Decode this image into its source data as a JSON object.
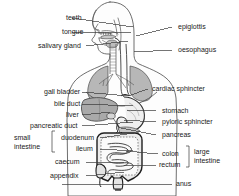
{
  "figure": {
    "background_color": "#ffffff",
    "text_color": "#1a1a1a",
    "line_color": "#3a3a3a",
    "width": 239,
    "height": 196
  },
  "labels_left": [
    {
      "id": "teeth",
      "text": "teeth",
      "x": 66,
      "y": 14,
      "line_x1": 72,
      "line_y1": 18,
      "line_x2": 133,
      "line_y2": 27
    },
    {
      "id": "tongue",
      "text": "tongue",
      "x": 62,
      "y": 28,
      "line_x1": 72,
      "line_y1": 32,
      "line_x2": 131,
      "line_y2": 33
    },
    {
      "id": "salivary-gland",
      "text": "salivary gland",
      "x": 38,
      "y": 42,
      "line_x1": 86,
      "line_y1": 46,
      "line_x2": 128,
      "line_y2": 41
    },
    {
      "id": "gall-bladder",
      "text": "gall bladder",
      "x": 44,
      "y": 88,
      "line_x1": 82,
      "line_y1": 92,
      "line_x2": 129,
      "line_y2": 96
    },
    {
      "id": "bile-duct",
      "text": "bile duct",
      "x": 54,
      "y": 100,
      "line_x1": 82,
      "line_y1": 104,
      "line_x2": 133,
      "line_y2": 106
    },
    {
      "id": "liver",
      "text": "liver",
      "x": 66,
      "y": 111,
      "line_x1": 82,
      "line_y1": 115,
      "line_x2": 110,
      "line_y2": 112
    },
    {
      "id": "pancreatic-duct",
      "text": "pancreatic duct",
      "x": 30,
      "y": 122,
      "line_x1": 82,
      "line_y1": 126,
      "line_x2": 133,
      "line_y2": 122
    },
    {
      "id": "duodenum",
      "text": "duodenum",
      "x": 61,
      "y": 134,
      "line_x1": 100,
      "line_y1": 138,
      "line_x2": 134,
      "line_y2": 133
    },
    {
      "id": "ileum",
      "text": "ileum",
      "x": 76,
      "y": 145,
      "line_x1": 100,
      "line_y1": 149,
      "line_x2": 133,
      "line_y2": 151
    },
    {
      "id": "caecum",
      "text": "caecum",
      "x": 55,
      "y": 158,
      "line_x1": 86,
      "line_y1": 162,
      "line_x2": 124,
      "line_y2": 163
    },
    {
      "id": "appendix",
      "text": "appendix",
      "x": 50,
      "y": 172,
      "line_x1": 86,
      "line_y1": 176,
      "line_x2": 124,
      "line_y2": 172
    }
  ],
  "labels_right": [
    {
      "id": "epiglottis",
      "text": "epiglottis",
      "x": 178,
      "y": 23,
      "line_x1": 172,
      "line_y1": 27,
      "line_x2": 136,
      "line_y2": 36
    },
    {
      "id": "oesophagus",
      "text": "oesophagus",
      "x": 178,
      "y": 46,
      "line_x1": 172,
      "line_y1": 50,
      "line_x2": 134,
      "line_y2": 52
    },
    {
      "id": "cardiac-sphincter",
      "text": "cardiac sphincter",
      "x": 152,
      "y": 85,
      "line_x1": 148,
      "line_y1": 89,
      "line_x2": 128,
      "line_y2": 96
    },
    {
      "id": "stomach",
      "text": "stomach",
      "x": 162,
      "y": 107,
      "line_x1": 156,
      "line_y1": 111,
      "line_x2": 127,
      "line_y2": 110
    },
    {
      "id": "pyloric-sphincter",
      "text": "pyloric sphincter",
      "x": 162,
      "y": 118,
      "line_x1": 156,
      "line_y1": 122,
      "line_x2": 124,
      "line_y2": 120
    },
    {
      "id": "pancreas",
      "text": "pancreas",
      "x": 162,
      "y": 131,
      "line_x1": 156,
      "line_y1": 135,
      "line_x2": 121,
      "line_y2": 128
    },
    {
      "id": "colon",
      "text": "colon",
      "x": 162,
      "y": 150,
      "line_x1": 158,
      "line_y1": 154,
      "line_x2": 126,
      "line_y2": 151
    },
    {
      "id": "rectum",
      "text": "rectum",
      "x": 159,
      "y": 161,
      "line_x1": 156,
      "line_y1": 165,
      "line_x2": 124,
      "line_y2": 166
    },
    {
      "id": "anus",
      "text": "anus",
      "x": 176,
      "y": 180,
      "line_x1": 172,
      "line_y1": 184,
      "line_x2": 62,
      "line_y2": 184
    }
  ],
  "grouped_labels": [
    {
      "id": "small-intestine",
      "lines": [
        "small",
        "intestine"
      ],
      "x": 14,
      "y": 134,
      "brace": {
        "x": 52,
        "y": 131,
        "height": 21,
        "side": "right"
      }
    },
    {
      "id": "large-intestine",
      "lines": [
        "large",
        "intestine"
      ],
      "x": 194,
      "y": 148,
      "brace": {
        "x": 189,
        "y": 146,
        "height": 21,
        "side": "left"
      }
    }
  ],
  "organs": [
    {
      "id": "head-profile",
      "name": "head profile"
    },
    {
      "id": "teeth",
      "name": "teeth"
    },
    {
      "id": "tongue",
      "name": "tongue"
    },
    {
      "id": "salivary-gland",
      "name": "salivary gland"
    },
    {
      "id": "epiglottis",
      "name": "epiglottis"
    },
    {
      "id": "oesophagus",
      "name": "oesophagus"
    },
    {
      "id": "lungs",
      "name": "lungs"
    },
    {
      "id": "diaphragm",
      "name": "diaphragm"
    },
    {
      "id": "cardiac-sphincter",
      "name": "cardiac sphincter"
    },
    {
      "id": "liver",
      "name": "liver"
    },
    {
      "id": "gall-bladder",
      "name": "gall bladder"
    },
    {
      "id": "bile-duct",
      "name": "bile duct"
    },
    {
      "id": "stomach",
      "name": "stomach"
    },
    {
      "id": "pyloric-sphincter",
      "name": "pyloric sphincter"
    },
    {
      "id": "pancreas",
      "name": "pancreas"
    },
    {
      "id": "pancreatic-duct",
      "name": "pancreatic duct"
    },
    {
      "id": "duodenum",
      "name": "duodenum"
    },
    {
      "id": "ileum",
      "name": "ileum"
    },
    {
      "id": "colon",
      "name": "colon"
    },
    {
      "id": "caecum",
      "name": "caecum"
    },
    {
      "id": "appendix",
      "name": "appendix"
    },
    {
      "id": "rectum",
      "name": "rectum"
    },
    {
      "id": "anus",
      "name": "anus"
    }
  ]
}
